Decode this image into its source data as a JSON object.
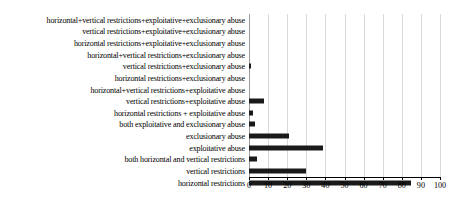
{
  "chart_data": {
    "type": "bar",
    "orientation": "horizontal",
    "title": "",
    "xlabel": "",
    "ylabel": "",
    "xlim": [
      0,
      100
    ],
    "xticks": [
      0,
      10,
      20,
      30,
      40,
      50,
      60,
      70,
      80,
      90,
      100
    ],
    "grid": true,
    "legend": "none",
    "bar_color": "#1a1a1a",
    "gridline_color": "#d9d9d9",
    "categories": [
      "horizontal+vertical restrictions+exploitative+exclusionary abuse",
      "vertical restrictions+exploitative+exclusionary abuse",
      "horizontal restrictions+exploitative+exclusionary abuse",
      "horizontal+vertical restrictions+exclusionary abuse",
      "vertical restrictions+exclusionary abuse",
      "horizontal restrictions+exclusionary abuse",
      "horizontal+vertical restrictions+exploitative abuse",
      "vertical restrictions+exploitative abuse",
      "horizontal restrictions + exploitative abuse",
      "both exploitative and exclusionary abuse",
      "exclusionary abuse",
      "exploitative abuse",
      "both horizontal and vertical restrictions",
      "vertical restrictions",
      "horizontal restrictions"
    ],
    "values": [
      0,
      0,
      0,
      0,
      1,
      0,
      0,
      8,
      2,
      3,
      21,
      39,
      4,
      30,
      85
    ]
  }
}
